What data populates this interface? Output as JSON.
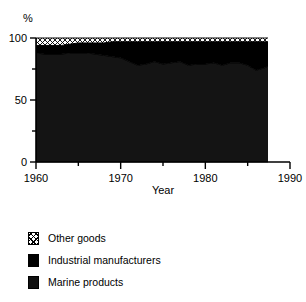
{
  "chart_data": {
    "type": "area",
    "title": "",
    "subtitle": "",
    "xlabel": "Year",
    "ylabel": "%",
    "xlim": [
      1960,
      1990
    ],
    "ylim": [
      0,
      100
    ],
    "grid": false,
    "legend_position": "below",
    "stacked": true,
    "x_ticks_major": [
      1960,
      1970,
      1980,
      1990
    ],
    "x_ticks_minor": [
      1965,
      1975,
      1985
    ],
    "y_ticks_major": [
      0,
      50,
      100
    ],
    "y_ticks_minor": [
      25,
      75
    ],
    "x_tick_labels": [
      "1960",
      "1970",
      "1980",
      "1990"
    ],
    "y_tick_labels": [
      "0",
      "50",
      "100"
    ],
    "x": [
      1960,
      1961,
      1962,
      1963,
      1964,
      1965,
      1966,
      1967,
      1968,
      1969,
      1970,
      1971,
      1972,
      1973,
      1974,
      1975,
      1976,
      1977,
      1978,
      1979,
      1980,
      1981,
      1982,
      1983,
      1984,
      1985,
      1986,
      1987,
      1988
    ],
    "series": [
      {
        "name": "Marine products",
        "color": "#141414",
        "pattern": "solid",
        "values": [
          88,
          87,
          87,
          87,
          88,
          88,
          88,
          87,
          86,
          85,
          84,
          81,
          78,
          79,
          81,
          79,
          80,
          81,
          78,
          79,
          79,
          80,
          78,
          80,
          80,
          78,
          74,
          76,
          79
        ]
      },
      {
        "name": "Industrial manufacturers",
        "color": "#000000",
        "pattern": "solid",
        "values": [
          6,
          7,
          7,
          7,
          7,
          8,
          8,
          9,
          10,
          12,
          13,
          16,
          19,
          18,
          16,
          18,
          17,
          16,
          19,
          18,
          18,
          17,
          19,
          17,
          17,
          19,
          23,
          21,
          18
        ]
      },
      {
        "name": "Other goods",
        "color": "#ffffff",
        "pattern": "crosshatch",
        "values": [
          6,
          6,
          6,
          6,
          5,
          4,
          4,
          4,
          4,
          3,
          3,
          3,
          3,
          3,
          3,
          3,
          3,
          3,
          3,
          3,
          3,
          3,
          3,
          3,
          3,
          3,
          3,
          3,
          3
        ]
      }
    ]
  },
  "axis": {
    "y_label": "%",
    "x_label": "Year"
  },
  "legend": {
    "items": [
      {
        "label": "Other goods",
        "swatch": "crosshatch-swatch"
      },
      {
        "label": "Industrial manufacturers",
        "swatch": "solid-black-swatch"
      },
      {
        "label": "Marine products",
        "swatch": "dark-gray-swatch"
      }
    ]
  }
}
